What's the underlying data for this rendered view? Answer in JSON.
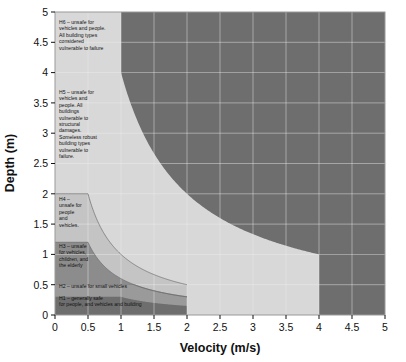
{
  "chart_data": {
    "type": "area",
    "title": "",
    "xlabel": "Velocity (m/s)",
    "ylabel": "Depth (m)",
    "xlim": [
      0,
      5
    ],
    "ylim": [
      0,
      5
    ],
    "xticks": [
      "0",
      "0.5",
      "1",
      "1.5",
      "2",
      "2.5",
      "3",
      "3.5",
      "4",
      "4.5",
      "5"
    ],
    "yticks": [
      "0",
      "0.5",
      "1",
      "1.5",
      "2",
      "2.5",
      "3",
      "3.5",
      "4",
      "4.5",
      "5"
    ],
    "xtick_values": [
      0,
      0.5,
      1,
      1.5,
      2,
      2.5,
      3,
      3.5,
      4,
      4.5,
      5
    ],
    "ytick_values": [
      0,
      0.5,
      1,
      1.5,
      2,
      2.5,
      3,
      3.5,
      4,
      4.5,
      5
    ],
    "grid": true,
    "legend_position": "none",
    "grid_color": "#f0f0f0",
    "plot_background": "#d8d8d8",
    "classification_scheme": "Flood hazard vulnerability curves (H1-H6)",
    "curve_form": "depth x velocity product thresholds with depth and velocity caps",
    "hazard_classes": [
      {
        "id": "H1",
        "label": "H1 – generally safe for people, and vehicles and building",
        "color": "#6e6e6e",
        "dv_threshold": 0.3,
        "depth_limit": 0.3,
        "velocity_limit": 2.0
      },
      {
        "id": "H2",
        "label": "H2 – unsafe for small vehicles",
        "color": "#9a9a9a",
        "dv_threshold": 0.6,
        "depth_limit": 0.5,
        "velocity_limit": 2.0
      },
      {
        "id": "H3",
        "label": "H3 – unsafe for vehicles, children, and the elderly",
        "color": "#8c8c8c",
        "dv_threshold": 0.6,
        "depth_limit": 1.2,
        "velocity_limit": 2.0
      },
      {
        "id": "H4",
        "label": "H4 – unsafe for people and vehicles",
        "color": "#c4c4c4",
        "dv_threshold": 1.0,
        "depth_limit": 2.0,
        "velocity_limit": 2.0
      },
      {
        "id": "H5",
        "label": "H5 – unsafe for vehicles and people. All buildings vulnerable to structural damages. Someless robust building types vulnerable to failure.",
        "color": "#d8d8d8",
        "dv_threshold": 4.0,
        "depth_limit": 4.0,
        "velocity_limit": 4.0
      },
      {
        "id": "H6",
        "label": "H6 – unsafe for vehicles and people. All building types considered vulnerable to failure",
        "color": "#6e6e6e",
        "dv_threshold": 4.0,
        "depth_limit": 5.0,
        "velocity_limit": 5.0
      }
    ]
  },
  "axes": {
    "x_title": "Velocity (m/s)",
    "y_title": "Depth (m)"
  },
  "bands": {
    "h6": {
      "lines": [
        "H6 – unsafe for",
        "vehicles and people.",
        "All building types",
        "considered",
        "vulnerable to failure"
      ]
    },
    "h5": {
      "lines": [
        "H5 – unsafe for",
        "vehicles and",
        "people. All",
        "buildings",
        "vulnerable to",
        "structural",
        "damages.",
        "Someless robust",
        "building types",
        "vulnerable to",
        "failure."
      ]
    },
    "h4": {
      "lines": [
        "H4 –",
        "unsafe for",
        "people",
        "and",
        "vehicles."
      ]
    },
    "h3": {
      "lines": [
        "H3 – unsafe",
        "for vehicles,",
        "children, and",
        "the elderly"
      ]
    },
    "h2": {
      "lines": [
        "H2 – unsafe for small vehicles"
      ]
    },
    "h1": {
      "lines": [
        "H1 – generally safe",
        "for people, and vehicles and building"
      ]
    }
  },
  "ticks": {
    "x": [
      "0",
      "0.5",
      "1",
      "1.5",
      "2",
      "2.5",
      "3",
      "3.5",
      "4",
      "4.5",
      "5"
    ],
    "y": [
      "5",
      "4.5",
      "4",
      "3.5",
      "3",
      "2.5",
      "2",
      "1.5",
      "1",
      "0.5",
      "0"
    ]
  },
  "colors": {
    "dark_gray": "#6e6e6e",
    "mid_gray": "#9a9a9a",
    "band_gray": "#8c8c8c",
    "light_mid_gray": "#c4c4c4",
    "light_gray": "#d8d8d8",
    "grid": "#f0f0f0",
    "text": "#111111",
    "page_background": "#ffffff"
  }
}
